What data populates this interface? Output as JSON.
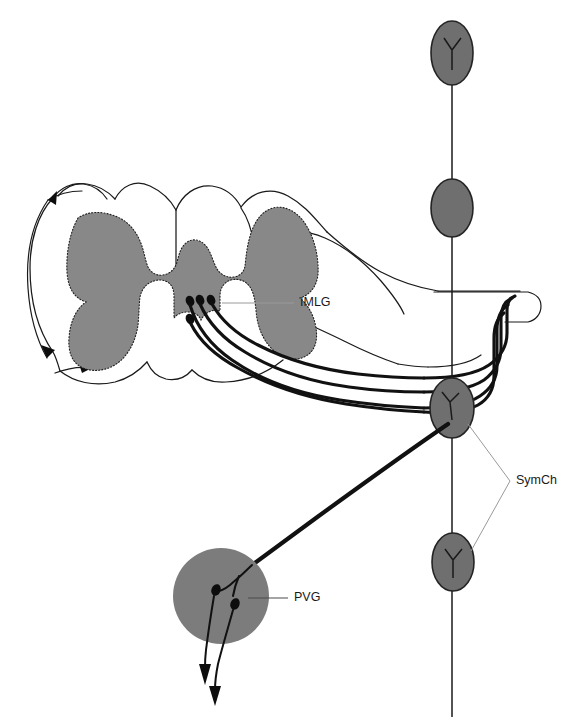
{
  "figure": {
    "background_color": "#ffffff",
    "width": 563,
    "height": 717
  },
  "colors": {
    "gray_matter_fill": "#888888",
    "ganglion_fill": "#6f6f6f",
    "pvg_fill": "#7c7c7c",
    "outline_stroke": "#1a1a1a",
    "nerve_stroke": "#111111",
    "leader_stroke": "#9a9a9a",
    "label_text": "#1a1a1a"
  },
  "labels": [
    {
      "id": "imlg",
      "text": "IMLG",
      "meaning": "intermediolateral cell group",
      "x": 300,
      "y": 303
    },
    {
      "id": "symch",
      "text": "SymCh",
      "meaning": "sympathetic chain",
      "x": 516,
      "y": 481
    },
    {
      "id": "pvg",
      "text": "PVG",
      "meaning": "prevertebral ganglion",
      "x": 294,
      "y": 598
    }
  ],
  "structures": {
    "spinal_cord": {
      "name": "spinal-cord-cross-section",
      "gray_matter": "butterfly-shaped gray matter with dotted border",
      "outline": "white matter outline with dorsal and ventral roots"
    },
    "sympathetic_chain": {
      "name": "sympathetic-chain",
      "ganglia_count": 3,
      "ganglia": [
        {
          "id": "ganglion-1",
          "cx": 452,
          "cy": 53,
          "rx": 21,
          "ry": 32
        },
        {
          "id": "ganglion-2",
          "cx": 452,
          "cy": 208,
          "rx": 21,
          "ry": 29
        },
        {
          "id": "ganglion-3",
          "cx": 452,
          "cy": 408,
          "rx": 22,
          "ry": 30
        },
        {
          "id": "ganglion-4",
          "cx": 453,
          "cy": 562,
          "rx": 21,
          "ry": 29
        }
      ]
    },
    "prevertebral_ganglion": {
      "name": "prevertebral-ganglion",
      "cx": 221,
      "cy": 596,
      "r": 48,
      "neuron_count": 2
    },
    "imlg_neurons": {
      "name": "imlg-neuron-cluster",
      "count": 4
    },
    "spinal_nerve": {
      "name": "spinal-nerve-trunk",
      "fiber_count": 4
    }
  }
}
